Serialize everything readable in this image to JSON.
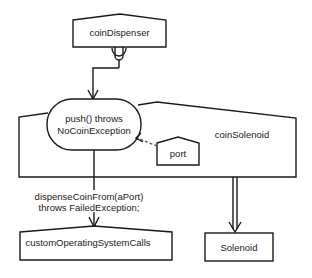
{
  "diagram": {
    "type": "object-interaction",
    "stroke_color": "#1a1a1a",
    "background": "#ffffff",
    "nodes": {
      "coinDispenser": {
        "label": "coinDispenser"
      },
      "pushOperation": {
        "line1": "push() throws",
        "line2": "NoCoinException"
      },
      "coinSolenoid": {
        "label": "coinSolenoid"
      },
      "port": {
        "label": "port"
      },
      "customOperatingSystemCalls": {
        "label": "customOperatingSystemCalls"
      },
      "solenoid": {
        "label": "Solenoid"
      }
    },
    "edges": {
      "dispenseCall": {
        "line1": "dispenseCoinFrom(aPort)",
        "line2": "throws FailedException;"
      }
    }
  }
}
